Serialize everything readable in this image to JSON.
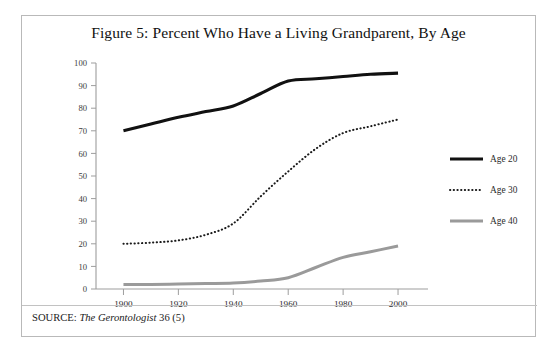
{
  "figure": {
    "title": "Figure 5: Percent Who Have a Living Grandparent, By Age",
    "source_label": "SOURCE:",
    "source_journal": "The Gerontologist",
    "source_rest": "36 (5)"
  },
  "chart_data": {
    "type": "line",
    "title": "Figure 5: Percent Who Have a Living Grandparent, By Age",
    "xlabel": "",
    "ylabel": "",
    "x": [
      1900,
      1910,
      1920,
      1930,
      1940,
      1950,
      1960,
      1970,
      1980,
      1990,
      2000
    ],
    "xtick_labels": [
      "1900",
      "1920",
      "1940",
      "1960",
      "1980",
      "2000"
    ],
    "xticks": [
      1900,
      1920,
      1940,
      1960,
      1980,
      2000
    ],
    "xlim": [
      1890,
      2008
    ],
    "ytick_labels": [
      "0",
      "10",
      "20",
      "30",
      "40",
      "50",
      "60",
      "70",
      "80",
      "90",
      "100"
    ],
    "yticks": [
      0,
      10,
      20,
      30,
      40,
      50,
      60,
      70,
      80,
      90,
      100
    ],
    "ylim": [
      0,
      100
    ],
    "grid": false,
    "legend_position": "right",
    "series": [
      {
        "name": "Age 20",
        "style": "solid",
        "color": "#111111",
        "width": 3.1,
        "values": [
          70,
          73,
          76,
          78.5,
          81,
          86.5,
          92,
          93,
          94,
          95,
          95.5
        ]
      },
      {
        "name": "Age 30",
        "style": "dotted",
        "color": "#1a1a1a",
        "width": 2.0,
        "values": [
          20,
          20.5,
          21.5,
          24,
          29,
          41,
          52,
          62,
          69,
          72,
          75
        ]
      },
      {
        "name": "Age 40",
        "style": "solid",
        "color": "#9a9a9a",
        "width": 3.0,
        "values": [
          2,
          2,
          2.2,
          2.4,
          2.6,
          3.5,
          5,
          9.5,
          14,
          16.5,
          19
        ]
      }
    ]
  },
  "legend": {
    "items": [
      {
        "label": "Age 20"
      },
      {
        "label": "Age 30"
      },
      {
        "label": "Age 40"
      }
    ]
  }
}
